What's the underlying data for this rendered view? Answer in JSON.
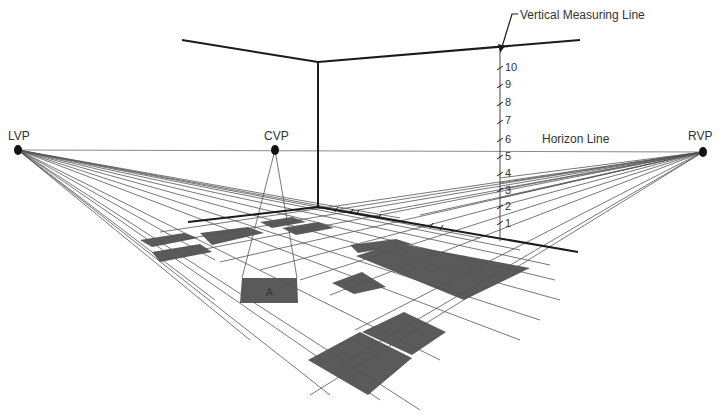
{
  "diagram": {
    "labels": {
      "lvp": "LVP",
      "cvp": "CVP",
      "rvp": "RVP",
      "horizon": "Horizon Line",
      "vertical_measuring_line": "Vertical Measuring Line",
      "square_a": "A"
    },
    "measuring_ticks": [
      "1",
      "2",
      "3",
      "4",
      "5",
      "6",
      "7",
      "8",
      "9",
      "10"
    ],
    "colors": {
      "line": "#1a1a1a",
      "thin_line": "#555555",
      "horizon": "#888888",
      "tile_fill": "#555555",
      "background": "#ffffff",
      "text": "#333333"
    },
    "vanishing_points": [
      {
        "name": "LVP",
        "x": 18,
        "y": 150
      },
      {
        "name": "CVP",
        "x": 275,
        "y": 150
      },
      {
        "name": "RVP",
        "x": 703,
        "y": 152
      }
    ]
  }
}
